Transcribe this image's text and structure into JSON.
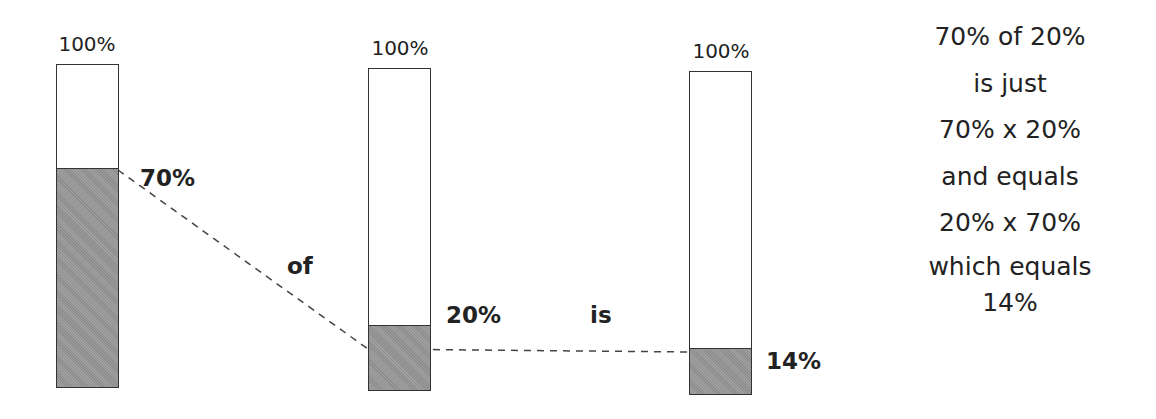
{
  "diagram": {
    "bars": [
      {
        "id": "bar-1",
        "top_label": "100%",
        "value_label": "70%",
        "fill_percent": 70
      },
      {
        "id": "bar-2",
        "top_label": "100%",
        "value_label": "20%",
        "fill_percent": 20
      },
      {
        "id": "bar-3",
        "top_label": "100%",
        "value_label": "14%",
        "fill_percent": 14
      }
    ],
    "connectors": {
      "of": "of",
      "is": "is"
    },
    "explanation": [
      "70% of 20%",
      "is just",
      "70% x 20%",
      "and equals",
      "20% x 70%",
      "which equals",
      "14%"
    ],
    "colors": {
      "fill": "#8c8c8c",
      "outline": "#333333",
      "text": "#222222"
    }
  }
}
